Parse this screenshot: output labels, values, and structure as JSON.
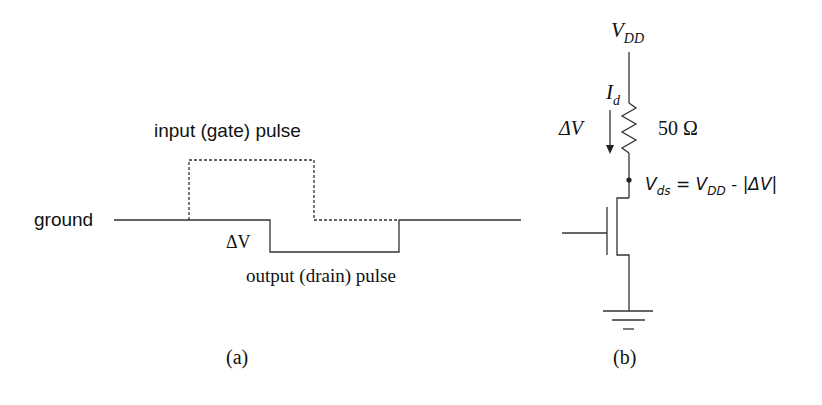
{
  "panel_a": {
    "caption": "(a)",
    "ground_label": "ground",
    "input_label": "input (gate) pulse",
    "output_label": "output (drain) pulse",
    "delta_v_label": "ΔV"
  },
  "panel_b": {
    "caption": "(b)",
    "vdd_label": "V",
    "vdd_sub": "DD",
    "current_label": "I",
    "current_sub": "d",
    "delta_v_label": "ΔV",
    "resistor_label": "50 Ω",
    "vds_label_v": "V",
    "vds_sub": "ds",
    "vds_eq": " = V",
    "vds_eq_sub": "DD",
    "vds_tail": " - |ΔV|"
  },
  "colors": {
    "line": "#333333",
    "text": "#111111"
  }
}
